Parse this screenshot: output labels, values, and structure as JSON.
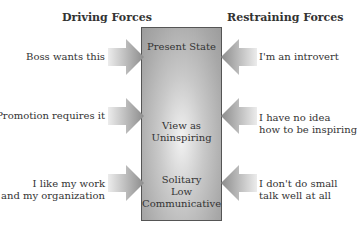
{
  "diagram": {
    "type": "force-field-analysis",
    "headers": {
      "driving": "Driving Forces",
      "restraining": "Restraining Forces"
    },
    "center": {
      "states": [
        {
          "label": "Present State"
        },
        {
          "label_lines": [
            "View as",
            "Uninspiring"
          ]
        },
        {
          "label_lines": [
            "Solitary",
            "Low",
            "Communicative"
          ]
        }
      ]
    },
    "driving_forces": [
      {
        "lines": [
          "Boss wants this"
        ]
      },
      {
        "lines": [
          "Promotion requires it"
        ]
      },
      {
        "lines": [
          "I like my work",
          "and my organization"
        ]
      }
    ],
    "restraining_forces": [
      {
        "lines": [
          "I'm an introvert"
        ]
      },
      {
        "lines": [
          "I have no idea",
          "how to be inspiring"
        ]
      },
      {
        "lines": [
          "I don't do small",
          "talk well at all"
        ]
      }
    ],
    "colors": {
      "arrow_light": "#e6e6e6",
      "arrow_dark": "#8c8c8c",
      "box_border": "#555555"
    }
  }
}
